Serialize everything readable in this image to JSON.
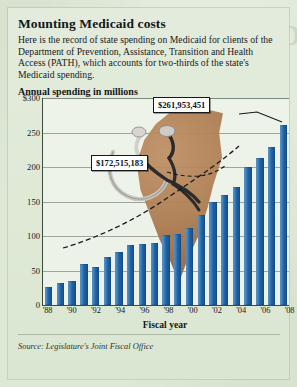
{
  "header": {
    "title": "Mounting Medicaid costs",
    "deck": "Here is the record of state spending on Medicaid for clients of the Department of Prevention, Assistance, Transition and Health Access (PATH), which accounts for two-thirds of the state's Medicaid spending."
  },
  "source": "Source: Legislature's Joint Fiscal Office",
  "colors": {
    "bar": "#1f5f9f",
    "bar_highlight": "#6fa8d6",
    "card_background": "#e3ecdc",
    "page_background": "#d7e3cf",
    "axis": "#3a4a3c",
    "grid": "#9aa79a",
    "map_blob": "#ad7c50",
    "callout_background": "#ffffff",
    "callout_border": "#15191b"
  },
  "chart_data": {
    "type": "bar",
    "title": "Annual spending in millions",
    "xlabel": "Fiscal year",
    "ylabel": "",
    "ylim": [
      0,
      300
    ],
    "yticks": [
      0,
      50,
      100,
      150,
      200,
      250,
      300
    ],
    "ytick_labels": [
      "0",
      "50",
      "100",
      "150",
      "200",
      "250",
      "$300"
    ],
    "grid": true,
    "legend": "none",
    "categories": [
      "'88",
      "'89",
      "'90",
      "'91",
      "'92",
      "'93",
      "'94",
      "'95",
      "'96",
      "'97",
      "'98",
      "'99",
      "'00",
      "'01",
      "'02",
      "'03",
      "'04",
      "'05",
      "'06",
      "'07",
      "'08"
    ],
    "xtick_labels": [
      "'88",
      "'90",
      "'92",
      "'94",
      "'96",
      "'98",
      "'00",
      "'02",
      "'04",
      "'06",
      "'08"
    ],
    "values": [
      27,
      33,
      36,
      60,
      55,
      70,
      78,
      88,
      89,
      90,
      102,
      103,
      112,
      131,
      150,
      160,
      172,
      200,
      213,
      230,
      262
    ],
    "annotations": [
      {
        "label": "$261,953,451",
        "category": "'08",
        "value": 262
      },
      {
        "label": "$172,515,183",
        "category": "'04",
        "value": 172
      }
    ]
  }
}
